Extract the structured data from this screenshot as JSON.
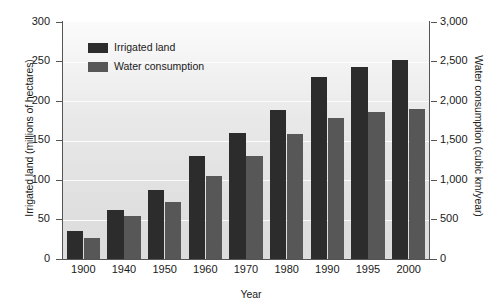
{
  "chart_data": {
    "type": "bar",
    "title": "",
    "xlabel": "Year",
    "ylabel": "Irrigated land (millions of hectares)",
    "ylabel_right": "Water consumption (cubic km/year)",
    "categories": [
      "1900",
      "1940",
      "1950",
      "1960",
      "1970",
      "1980",
      "1990",
      "1995",
      "2000"
    ],
    "series": [
      {
        "name": "Irrigated land",
        "axis": "left",
        "unit": "millions of hectares",
        "color": "#2c2c2c",
        "values": [
          35,
          62,
          87,
          130,
          160,
          188,
          231,
          243,
          252
        ]
      },
      {
        "name": "Water consumption",
        "axis": "right",
        "unit": "cubic km/year",
        "color": "#575757",
        "values": [
          270,
          540,
          720,
          1050,
          1300,
          1580,
          1780,
          1860,
          1900
        ]
      }
    ],
    "ylim": [
      0,
      300
    ],
    "ylim_right": [
      0,
      3000
    ],
    "yticks": [
      "0",
      "50",
      "100",
      "150",
      "200",
      "250",
      "300"
    ],
    "yticks_right": [
      "0",
      "500",
      "1,000",
      "1,500",
      "2,000",
      "2,500",
      "3,000"
    ],
    "grid": true,
    "legend_position": "top-left"
  },
  "legend": {
    "items": [
      {
        "label": "Irrigated land",
        "color": "#2c2c2c"
      },
      {
        "label": "Water consumption",
        "color": "#575757"
      }
    ]
  }
}
